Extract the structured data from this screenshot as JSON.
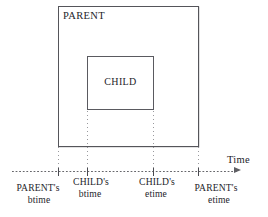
{
  "figure": {
    "boxes": [
      {
        "id": "parent",
        "label": "PARENT"
      },
      {
        "id": "child",
        "label": "CHILD"
      }
    ],
    "axis": {
      "label": "Time",
      "arrow_icon": "arrow-right-icon",
      "ticks": [
        {
          "id": "parent-btime",
          "line1": "PARENT's",
          "line2": "btime"
        },
        {
          "id": "child-btime",
          "line1": "CHILD's",
          "line2": "btime"
        },
        {
          "id": "child-etime",
          "line1": "CHILD's",
          "line2": "etime"
        },
        {
          "id": "parent-etime",
          "line1": "PARENT's",
          "line2": "etime"
        }
      ]
    },
    "colors": {
      "box_stroke": "#55555a",
      "axis_stroke": "#5f5f64",
      "guide_stroke": "#78787d",
      "text": "#24242a",
      "background": "#ffffff"
    }
  }
}
